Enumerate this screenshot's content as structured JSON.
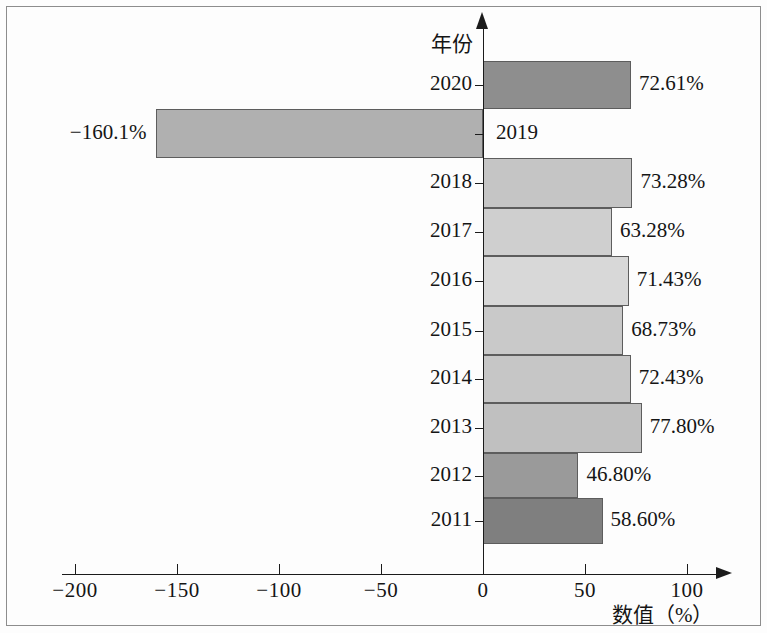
{
  "chart_data": {
    "type": "bar",
    "orientation": "horizontal",
    "title": "",
    "xlabel": "数值（%）",
    "ylabel": "年份",
    "xlim": [
      -215,
      115
    ],
    "xticks": [
      -200,
      -150,
      -100,
      -50,
      0,
      50,
      100
    ],
    "xtick_labels": [
      "−200",
      "−150",
      "−100",
      "−50",
      "0",
      "50",
      "100"
    ],
    "grid": false,
    "legend": "none",
    "categories": [
      "2020",
      "2019",
      "2018",
      "2017",
      "2016",
      "2015",
      "2014",
      "2013",
      "2012",
      "2011"
    ],
    "values": [
      72.61,
      -160.1,
      73.28,
      63.28,
      71.43,
      68.73,
      72.43,
      77.8,
      46.8,
      58.6
    ],
    "data_labels": [
      "72.61%",
      "−160.1%",
      "73.28%",
      "63.28%",
      "71.43%",
      "68.73%",
      "72.43%",
      "77.80%",
      "46.80%",
      "58.60%"
    ],
    "bar_colors": [
      "#8e8e8e",
      "#b0b0b0",
      "#c5c5c5",
      "#cfcfcf",
      "#d8d8d8",
      "#c9c9c9",
      "#c6c6c6",
      "#c0c0c0",
      "#9a9a9a",
      "#7f7f7f"
    ],
    "bars": [
      {
        "year": "2020",
        "value": 72.61,
        "label": "72.61%",
        "color": "#8e8e8e",
        "y": 61,
        "h": 48,
        "label_side": "right",
        "year_side": "left"
      },
      {
        "year": "2019",
        "value": -160.1,
        "label": "−160.1%",
        "color": "#b0b0b0",
        "y": 109,
        "h": 49,
        "label_side": "left",
        "year_side": "right"
      },
      {
        "year": "2018",
        "value": 73.28,
        "label": "73.28%",
        "color": "#c5c5c5",
        "y": 158,
        "h": 50,
        "label_side": "right",
        "year_side": "left"
      },
      {
        "year": "2017",
        "value": 63.28,
        "label": "63.28%",
        "color": "#cfcfcf",
        "y": 208,
        "h": 48,
        "label_side": "right",
        "year_side": "left"
      },
      {
        "year": "2016",
        "value": 71.43,
        "label": "71.43%",
        "color": "#d8d8d8",
        "y": 256,
        "h": 50,
        "label_side": "right",
        "year_side": "left"
      },
      {
        "year": "2015",
        "value": 68.73,
        "label": "68.73%",
        "color": "#c9c9c9",
        "y": 306,
        "h": 49,
        "label_side": "right",
        "year_side": "left"
      },
      {
        "year": "2014",
        "value": 72.43,
        "label": "72.43%",
        "color": "#c6c6c6",
        "y": 355,
        "h": 48,
        "label_side": "right",
        "year_side": "left"
      },
      {
        "year": "2013",
        "value": 77.8,
        "label": "77.80%",
        "color": "#c0c0c0",
        "y": 403,
        "h": 50,
        "label_side": "right",
        "year_side": "left"
      },
      {
        "year": "2012",
        "value": 46.8,
        "label": "46.80%",
        "color": "#9a9a9a",
        "y": 453,
        "h": 45,
        "label_side": "right",
        "year_side": "left"
      },
      {
        "year": "2011",
        "value": 58.6,
        "label": "58.60%",
        "color": "#7f7f7f",
        "y": 498,
        "h": 46,
        "label_side": "right",
        "year_side": "left"
      }
    ]
  }
}
